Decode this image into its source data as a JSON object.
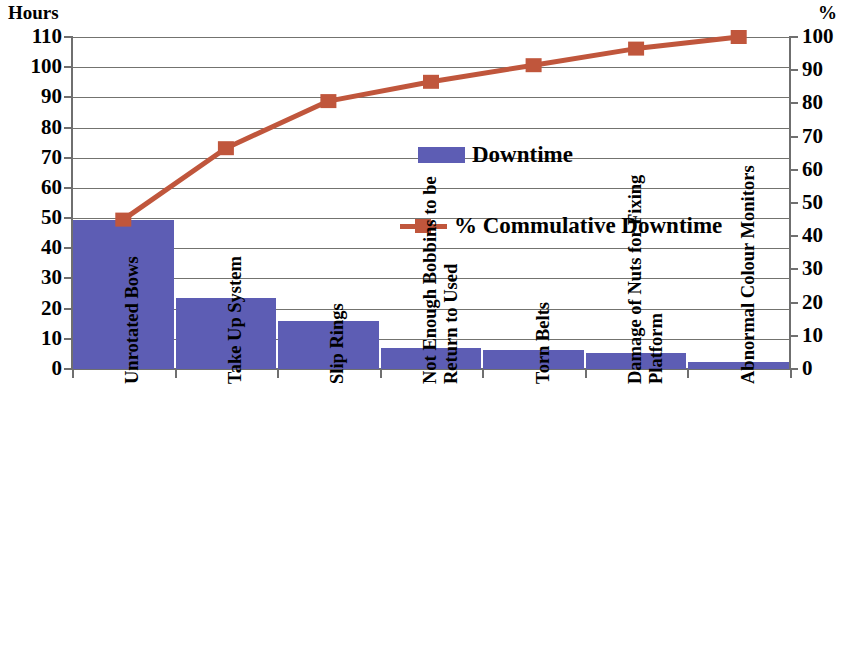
{
  "chart_data": {
    "type": "bar",
    "title": "",
    "subtitle": "",
    "xlabel": "",
    "ylabel": "Hours",
    "y2label": "%",
    "categories": [
      "Unrotated Bows",
      "Take Up System",
      "Slip Rings",
      "Not Enough Bobbins to be Return to Used",
      "Torn Belts",
      "Damage of Nuts for Fixing Platform",
      "Abnormal Colour Monitors"
    ],
    "category_lines": [
      [
        "Unrotated Bows"
      ],
      [
        "Take Up System"
      ],
      [
        "Slip Rings"
      ],
      [
        "Not Enough Bobbins to be",
        "Return to Used"
      ],
      [
        "Torn Belts"
      ],
      [
        "Damage of Nuts for Fixing",
        "Platform"
      ],
      [
        "Abnormal Colour Monitors"
      ]
    ],
    "series": [
      {
        "name": "Downtime",
        "type": "bar",
        "axis": "left",
        "unit": "Hours",
        "color": "#5d5db4",
        "values": [
          49.5,
          23.5,
          15.8,
          7.0,
          6.2,
          5.4,
          2.4
        ]
      },
      {
        "name": "% Commulative Downtime",
        "type": "line",
        "axis": "right",
        "unit": "%",
        "color": "#c0563c",
        "values": [
          45,
          66.5,
          80.7,
          86.5,
          91.5,
          96.5,
          100
        ]
      }
    ],
    "ylim": [
      0,
      110
    ],
    "y2lim": [
      0,
      100
    ],
    "yticks": [
      0,
      10,
      20,
      30,
      40,
      50,
      60,
      70,
      80,
      90,
      100,
      110
    ],
    "y2ticks": [
      0,
      10,
      20,
      30,
      40,
      50,
      60,
      70,
      80,
      90,
      100
    ],
    "grid": true,
    "legend_position": "inside-right",
    "legend": [
      {
        "label": "Downtime",
        "marker": "square-swatch",
        "color": "#5d5db4"
      },
      {
        "label": "% Commulative Downtime",
        "marker": "line-with-square",
        "color": "#c0563c"
      }
    ]
  }
}
